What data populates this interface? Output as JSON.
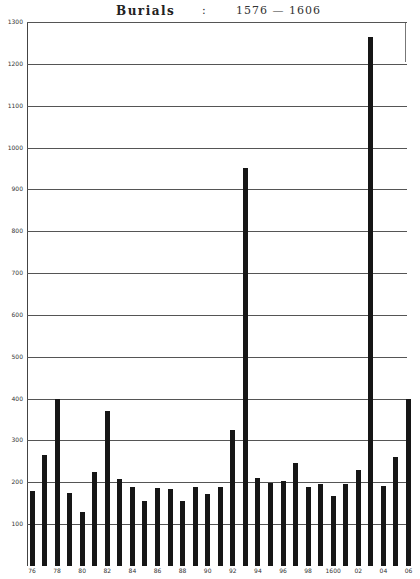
{
  "title": {
    "word": "Burials",
    "separator": ":",
    "range": "1576 — 1606"
  },
  "chart_data": {
    "type": "bar",
    "title": "Burials : 1576 — 1606",
    "xlabel": "",
    "ylabel": "",
    "ylim": [
      0,
      1300
    ],
    "grid": true,
    "legend": null,
    "yticks": [
      100,
      200,
      300,
      400,
      500,
      600,
      700,
      800,
      900,
      1000,
      1100,
      1200,
      1300
    ],
    "xtick_labels": [
      "76",
      "78",
      "80",
      "82",
      "84",
      "86",
      "88",
      "90",
      "92",
      "94",
      "96",
      "98",
      "1600",
      "02",
      "04",
      "06"
    ],
    "categories": [
      "1576",
      "1577",
      "1578",
      "1579",
      "1580",
      "1581",
      "1582",
      "1583",
      "1584",
      "1585",
      "1586",
      "1587",
      "1588",
      "1589",
      "1590",
      "1591",
      "1592",
      "1593",
      "1594",
      "1595",
      "1596",
      "1597",
      "1598",
      "1599",
      "1600",
      "1601",
      "1602",
      "1603",
      "1604",
      "1605",
      "1606"
    ],
    "values": [
      180,
      265,
      400,
      175,
      130,
      225,
      370,
      207,
      188,
      155,
      186,
      183,
      155,
      189,
      172,
      189,
      326,
      950,
      210,
      198,
      204,
      245,
      189,
      197,
      168,
      195,
      230,
      1265,
      191,
      260,
      400
    ]
  }
}
